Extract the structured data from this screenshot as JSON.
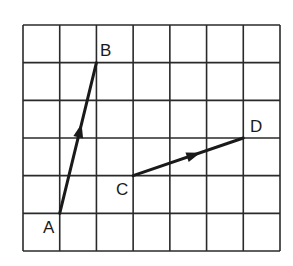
{
  "grid": {
    "cols": 7,
    "rows": 6,
    "left": 23,
    "top": 25,
    "right": 280,
    "bottom": 251,
    "line_color": "#2a2a2a"
  },
  "points": {
    "A": {
      "label": "A",
      "col": 1,
      "row": 5
    },
    "B": {
      "label": "B",
      "col": 2,
      "row": 1
    },
    "C": {
      "label": "C",
      "col": 3,
      "row": 4
    },
    "D": {
      "label": "D",
      "col": 6,
      "row": 3
    }
  },
  "vectors": [
    {
      "from": "A",
      "to": "B",
      "name": "vector-ab"
    },
    {
      "from": "C",
      "to": "D",
      "name": "vector-cd"
    }
  ],
  "labels": {
    "A": "A",
    "B": "B",
    "C": "C",
    "D": "D"
  },
  "colors": {
    "ink": "#1a1a1a",
    "background": "#ffffff"
  }
}
